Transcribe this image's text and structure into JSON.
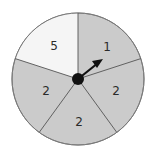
{
  "spinner": {
    "sections": [
      {
        "label": "1",
        "color": "#cbcbcb"
      },
      {
        "label": "2",
        "color": "#cbcbcb"
      },
      {
        "label": "2",
        "color": "#cbcbcb"
      },
      {
        "label": "2",
        "color": "#cbcbcb"
      },
      {
        "label": "5",
        "color": "#f5f5f5"
      }
    ],
    "border_color": "#6e6e6e",
    "pointer_color": "#111111"
  }
}
